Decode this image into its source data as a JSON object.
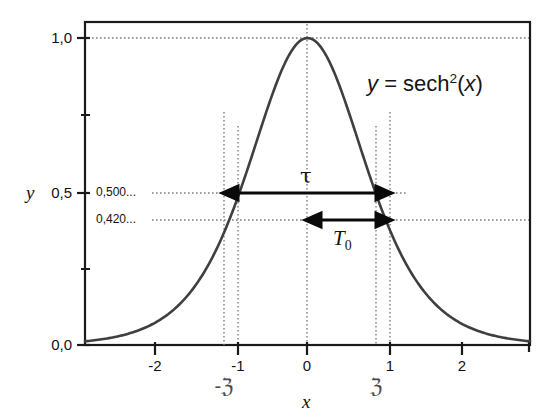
{
  "chart_data": {
    "type": "line",
    "title": "",
    "equation_label": "y = sech2(x)",
    "equation_parts": {
      "lhs": "y",
      "eq": " = ",
      "fn": "sech",
      "exponent": "2",
      "arg_open": "(",
      "arg": "x",
      "arg_close": ")"
    },
    "xlabel": "x",
    "ylabel": "y",
    "xlim": [
      -2.9,
      2.9
    ],
    "ylim": [
      -0.02,
      1.05
    ],
    "grid": false,
    "legend": "none",
    "x_tick_labels": [
      "-2",
      "-1",
      "0",
      "1",
      "2"
    ],
    "x_tick_values": [
      -2,
      -1,
      0,
      1,
      2
    ],
    "y_tick_labels": [
      "0,0",
      "0,5",
      "1,0"
    ],
    "y_tick_values": [
      0.0,
      0.5,
      1.0
    ],
    "y_minor_ticks": [
      0.25,
      0.75
    ],
    "series": [
      {
        "name": "sech^2(x)",
        "color": "#3f3f3f",
        "x": [
          -2.9,
          -2.7,
          -2.5,
          -2.3,
          -2.1,
          -1.9,
          -1.7,
          -1.5,
          -1.3,
          -1.1,
          -0.9,
          -0.7,
          -0.5,
          -0.3,
          -0.1,
          0.0,
          0.1,
          0.3,
          0.5,
          0.7,
          0.9,
          1.1,
          1.3,
          1.5,
          1.7,
          1.9,
          2.1,
          2.3,
          2.5,
          2.7,
          2.9
        ],
        "values": [
          0.012,
          0.017,
          0.026,
          0.038,
          0.056,
          0.083,
          0.121,
          0.18,
          0.26,
          0.37,
          0.51,
          0.66,
          0.79,
          0.92,
          0.99,
          1.0,
          0.99,
          0.92,
          0.79,
          0.66,
          0.51,
          0.37,
          0.26,
          0.18,
          0.121,
          0.083,
          0.056,
          0.038,
          0.026,
          0.017,
          0.012
        ]
      }
    ],
    "annotations": [
      {
        "name": "value-callout-tau",
        "text": "0,500...",
        "y_value": 0.5
      },
      {
        "name": "value-callout-t0",
        "text": "0,420...",
        "y_value": 0.42
      },
      {
        "name": "arrow-label-tau",
        "text": "τ"
      },
      {
        "name": "arrow-label-t0",
        "text": "T0"
      },
      {
        "name": "x-marker-negative-z",
        "text": "-ℨ",
        "x_value": -0.8814
      },
      {
        "name": "x-marker-positive-z",
        "text": "ℨ",
        "x_value": 0.8814
      }
    ],
    "guide_lines": {
      "horizontal": [
        1.0,
        0.5,
        0.42
      ],
      "vertical": [
        -1.0,
        -0.8814,
        0.0,
        0.8814,
        1.0
      ]
    },
    "measures": {
      "tau": {
        "label": "τ",
        "at_y": 0.5,
        "from_x": -0.8814,
        "to_x": 0.8814
      },
      "T0": {
        "label": "T",
        "sub": "0",
        "at_y": 0.42,
        "from_x": 0.0,
        "to_x": 0.8814
      }
    }
  },
  "labels": {
    "y_axis_name": "y",
    "x_axis_name": "x",
    "ytick_1_0": "1,0",
    "ytick_0_5": "0,5",
    "ytick_0_0": "0,0",
    "xtick_m2": "-2",
    "xtick_m1": "-1",
    "xtick_0": "0",
    "xtick_1": "1",
    "xtick_2": "2",
    "callout_500": "0,500...",
    "callout_420": "0,420...",
    "z_negative": "-ℨ",
    "z_positive": "ℨ",
    "tau": "τ",
    "t_letter": "T",
    "t_sub": "0",
    "eq_lhs": "y",
    "eq_sign": "=",
    "eq_fn": "sech",
    "eq_exp": "2",
    "eq_open": "(",
    "eq_arg": "x",
    "eq_close": ")"
  },
  "colors": {
    "curve": "#3f3f3f",
    "frame": "#1a1a1a",
    "guide": "#808080",
    "arrow": "#0a0a0a",
    "text": "#111111",
    "z_glyph": "#4a4a4a",
    "background": "#ffffff"
  }
}
